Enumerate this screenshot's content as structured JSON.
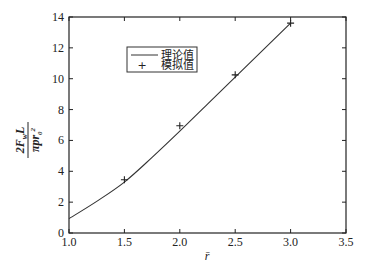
{
  "chart_data": {
    "type": "line",
    "title": "",
    "xlabel": "r̄",
    "ylabel": "2F_w L / (π p r₀²)",
    "ylabel_parts": {
      "numerator": "2F",
      "numerator_sub": "w",
      "numerator_tail": "L",
      "denominator": "πpr",
      "denominator_sub": "0",
      "denominator_sup": "2"
    },
    "xlim": [
      1.0,
      3.5
    ],
    "ylim": [
      0,
      14
    ],
    "x_ticks": [
      "1.0",
      "1.5",
      "2.0",
      "2.5",
      "3.0",
      "3.5"
    ],
    "y_ticks": [
      "0",
      "2",
      "4",
      "6",
      "8",
      "10",
      "12",
      "14"
    ],
    "grid": false,
    "legend_position": "upper-left-inside",
    "series": [
      {
        "name": "理论值",
        "style": "line",
        "x": [
          1.0,
          1.25,
          1.5,
          1.75,
          2.0,
          2.25,
          2.5,
          2.75,
          3.0
        ],
        "values": [
          0.93,
          2.05,
          3.3,
          4.9,
          6.6,
          8.35,
          10.1,
          11.85,
          13.6
        ]
      },
      {
        "name": "模拟值",
        "style": "marker-plus",
        "x": [
          1.5,
          2.0,
          2.5,
          3.0
        ],
        "values": [
          3.45,
          6.95,
          10.25,
          13.6
        ]
      }
    ]
  },
  "legend": {
    "items": [
      {
        "label": "理论值",
        "symbol": "line"
      },
      {
        "label": "模拟值",
        "symbol": "+"
      }
    ]
  },
  "axes": {
    "x_label": "r̄"
  },
  "colors": {
    "line": "#333333",
    "axis": "#222222",
    "background": "#ffffff"
  }
}
